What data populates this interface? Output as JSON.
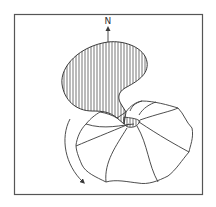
{
  "diagram": {
    "north_label": "N",
    "colors": {
      "line": "#3a3a3a",
      "frame": "#555555",
      "background": "#ffffff"
    },
    "elements": [
      "frame-border",
      "north-arrow",
      "hatched-lobe",
      "scalloped-rosette-body",
      "central-hub",
      "curved-rotation-arrow"
    ]
  }
}
